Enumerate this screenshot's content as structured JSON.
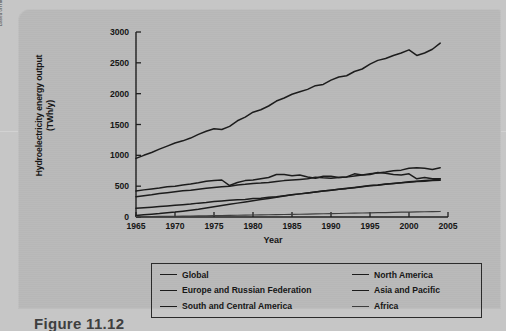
{
  "source_credit": "Based on http://openlearn.open.ac.uk/file.php/4184/!via^ucontent/course/479/s278_8_f024hi.jpg",
  "figure_caption": "Figure 11.12",
  "colors": {
    "page_background": "#c6c6c6",
    "panel_background": "#b9b9b9",
    "line": "#1b1b1b",
    "africa_line": "#3d3d3d",
    "axis": "#1f1f1f",
    "text": "#141414"
  },
  "legend": {
    "items": [
      {
        "label": "Global",
        "column": "left",
        "style": "solid"
      },
      {
        "label": "North America",
        "column": "right",
        "style": "solid"
      },
      {
        "label": "Europe and Russian Federation",
        "column": "left",
        "style": "solid"
      },
      {
        "label": "Asia and Pacific",
        "column": "right",
        "style": "solid"
      },
      {
        "label": "South and Central America",
        "column": "left",
        "style": "solid"
      },
      {
        "label": "Africa",
        "column": "right",
        "style": "thin"
      }
    ]
  },
  "chart_data": {
    "type": "line",
    "title": "",
    "xlabel": "Year",
    "ylabel": "Hydroelectricity energy output (TWh/y)",
    "xlim": [
      1965,
      2005
    ],
    "ylim": [
      0,
      3000
    ],
    "xticks": [
      1965,
      1970,
      1975,
      1980,
      1985,
      1990,
      1995,
      2000,
      2005
    ],
    "yticks": [
      0,
      500,
      1000,
      1500,
      2000,
      2500,
      3000
    ],
    "grid": false,
    "legend_position": "below-plot",
    "x": [
      1965,
      1966,
      1967,
      1968,
      1969,
      1970,
      1971,
      1972,
      1973,
      1974,
      1975,
      1976,
      1977,
      1978,
      1979,
      1980,
      1981,
      1982,
      1983,
      1984,
      1985,
      1986,
      1987,
      1988,
      1989,
      1990,
      1991,
      1992,
      1993,
      1994,
      1995,
      1996,
      1997,
      1998,
      1999,
      2000,
      2001,
      2002,
      2003,
      2004
    ],
    "series": [
      {
        "name": "Global",
        "values": [
          950,
          1000,
          1045,
          1100,
          1150,
          1200,
          1235,
          1280,
          1340,
          1390,
          1430,
          1420,
          1470,
          1560,
          1620,
          1700,
          1740,
          1800,
          1880,
          1930,
          1990,
          2030,
          2070,
          2130,
          2150,
          2220,
          2270,
          2290,
          2360,
          2400,
          2480,
          2540,
          2570,
          2620,
          2660,
          2710,
          2620,
          2660,
          2720,
          2820
        ]
      },
      {
        "name": "North America",
        "values": [
          420,
          440,
          455,
          470,
          490,
          500,
          520,
          535,
          555,
          580,
          590,
          600,
          510,
          560,
          590,
          600,
          620,
          640,
          690,
          690,
          670,
          680,
          650,
          630,
          660,
          660,
          640,
          650,
          700,
          680,
          690,
          720,
          710,
          690,
          680,
          700,
          620,
          640,
          620,
          620
        ]
      },
      {
        "name": "Europe and Russian Federation",
        "values": [
          330,
          345,
          360,
          380,
          395,
          410,
          425,
          435,
          450,
          465,
          480,
          490,
          500,
          520,
          530,
          545,
          550,
          560,
          575,
          590,
          600,
          610,
          620,
          645,
          635,
          630,
          640,
          650,
          665,
          680,
          700,
          715,
          730,
          750,
          760,
          790,
          800,
          790,
          770,
          800
        ]
      },
      {
        "name": "Asia and Pacific",
        "values": [
          140,
          150,
          160,
          170,
          180,
          190,
          200,
          210,
          225,
          235,
          250,
          260,
          270,
          280,
          285,
          300,
          305,
          320,
          330,
          345,
          360,
          375,
          390,
          405,
          420,
          435,
          450,
          460,
          475,
          490,
          505,
          515,
          530,
          545,
          555,
          570,
          580,
          590,
          600,
          615
        ]
      },
      {
        "name": "South and Central America",
        "values": [
          25,
          35,
          45,
          55,
          68,
          80,
          95,
          110,
          125,
          145,
          165,
          185,
          205,
          225,
          245,
          265,
          285,
          300,
          320,
          340,
          360,
          375,
          390,
          405,
          420,
          435,
          450,
          465,
          480,
          495,
          510,
          520,
          535,
          545,
          555,
          565,
          575,
          580,
          590,
          595
        ]
      },
      {
        "name": "Africa",
        "values": [
          5,
          6,
          8,
          9,
          11,
          12,
          14,
          16,
          18,
          20,
          22,
          24,
          26,
          28,
          30,
          32,
          34,
          36,
          38,
          40,
          42,
          45,
          47,
          50,
          52,
          55,
          57,
          60,
          62,
          65,
          68,
          70,
          72,
          75,
          78,
          80,
          82,
          85,
          88,
          90
        ]
      }
    ]
  }
}
